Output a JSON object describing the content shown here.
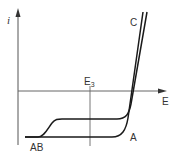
{
  "diagram": {
    "type": "current-potential curves",
    "axes": {
      "y_label": "i",
      "x_label": "E",
      "marker_label_main": "E",
      "marker_label_sub": "3"
    },
    "curves": [
      {
        "name": "curve-A",
        "label": "A"
      },
      {
        "name": "curve-C",
        "label": "C"
      }
    ],
    "baseline_label": "AB",
    "colors": {
      "line": "#1a1a1a",
      "axis": "#555555",
      "text": "#333333"
    }
  }
}
